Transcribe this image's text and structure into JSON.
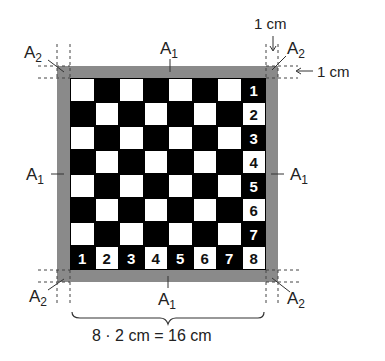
{
  "labels": {
    "a1": {
      "base": "A",
      "sub": "1"
    },
    "a2": {
      "base": "A",
      "sub": "2"
    }
  },
  "dimensions": {
    "top_dim": "1 cm",
    "right_dim": "1 cm",
    "bottom_formula": "8 · 2 cm = 16 cm"
  },
  "board": {
    "rows": 8,
    "cols": 8,
    "right_column_numbers": [
      "1",
      "2",
      "3",
      "4",
      "5",
      "6",
      "7",
      "8"
    ],
    "bottom_row_numbers": [
      "1",
      "2",
      "3",
      "4",
      "5",
      "6",
      "7",
      "8"
    ],
    "colors": {
      "frame": "#8a8a8a",
      "dark": "#000000",
      "light": "#ffffff"
    }
  }
}
